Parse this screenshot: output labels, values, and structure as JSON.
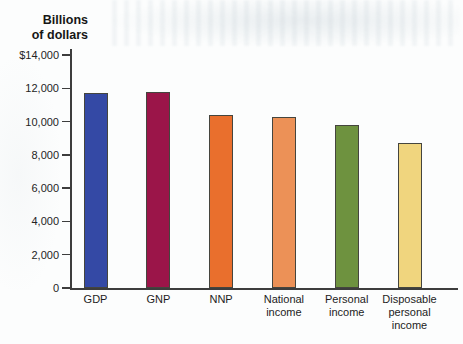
{
  "chart_data": {
    "type": "bar",
    "title": "",
    "y_axis_title": "Billions\nof dollars",
    "xlabel": "",
    "ylabel": "Billions of dollars",
    "categories": [
      "GDP",
      "GNP",
      "NNP",
      "National\nincome",
      "Personal\nincome",
      "Disposable\npersonal\nincome"
    ],
    "values": [
      11700,
      11800,
      10400,
      10300,
      9800,
      8700
    ],
    "bar_colors": [
      "#3449a5",
      "#9b1549",
      "#e96f2d",
      "#ec9157",
      "#6e923f",
      "#f0d57e"
    ],
    "ylim": [
      0,
      14000
    ],
    "yticks": [
      0,
      2000,
      4000,
      6000,
      8000,
      10000,
      12000,
      14000
    ],
    "ytick_labels": [
      "0",
      "2,000",
      "4,000",
      "6,000",
      "8,000",
      "10,000",
      "12,000",
      "$14,000"
    ],
    "grid": false,
    "legend": "none",
    "axis_color": "#3d3d3d",
    "bar_border_color": "#45453e"
  }
}
